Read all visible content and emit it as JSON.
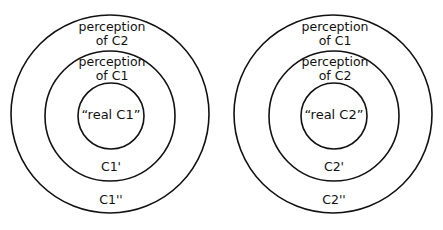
{
  "diagrams": [
    {
      "name": "C1",
      "outer_label": [
        "perception",
        "of C2"
      ],
      "middle_label": [
        "perception",
        "of C1"
      ],
      "inner_label": "“real C1”",
      "middle_ring_label": "C1'",
      "outer_ring_label": "C1''"
    },
    {
      "name": "C2",
      "outer_label": [
        "perception",
        "of C1"
      ],
      "middle_label": [
        "perception",
        "of C2"
      ],
      "inner_label": "“real C2”",
      "middle_ring_label": "C2'",
      "outer_ring_label": "C2''"
    }
  ],
  "colors": {
    "stroke": "#111111",
    "background": "#ffffff"
  }
}
